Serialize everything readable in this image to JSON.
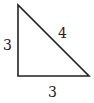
{
  "diagram": {
    "type": "right-triangle",
    "stroke_color": "#222222",
    "vertices": {
      "top": [
        18,
        5
      ],
      "bottom_left": [
        18,
        76
      ],
      "bottom_right": [
        89,
        76
      ]
    },
    "labels": {
      "left_side": "3",
      "hypotenuse": "4",
      "bottom_side": "3"
    }
  }
}
